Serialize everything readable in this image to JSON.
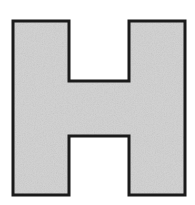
{
  "image": {
    "kind": "line-drawing",
    "subject": "letter-h-glyph",
    "label": "H",
    "description": "Outlined capital letter H filled with light gray texture on a white background",
    "width": 195,
    "height": 205
  },
  "colors": {
    "background": "#ffffff",
    "fill": "#c8c8c8",
    "fill_noise_light": "#d2d2d2",
    "fill_noise_dark": "#bebebe",
    "outline": "#1a1a1a"
  },
  "shape": {
    "name": "capital-h",
    "stroke_width": 3,
    "bounds": {
      "left": 13,
      "top": 21,
      "right": 185,
      "bottom": 195
    },
    "metrics": {
      "left_stem_left": 13,
      "left_stem_right": 69,
      "right_stem_left": 129,
      "right_stem_right": 185,
      "crossbar_top": 81,
      "crossbar_bottom": 136,
      "stem_width": 56,
      "crossbar_height": 55,
      "notch_width": 60
    },
    "path": "M 13 21 L 69 21 L 69 81 L 129 81 L 129 21 L 185 21 L 185 195 L 129 195 L 129 136 L 69 136 L 69 195 L 13 195 Z",
    "vertices": [
      [
        13,
        21
      ],
      [
        69,
        21
      ],
      [
        69,
        81
      ],
      [
        129,
        81
      ],
      [
        129,
        21
      ],
      [
        185,
        21
      ],
      [
        185,
        195
      ],
      [
        129,
        195
      ],
      [
        129,
        136
      ],
      [
        69,
        136
      ],
      [
        69,
        195
      ],
      [
        13,
        195
      ]
    ]
  },
  "parts": [
    {
      "name": "left-stem",
      "label": "Left vertical stem"
    },
    {
      "name": "right-stem",
      "label": "Right vertical stem"
    },
    {
      "name": "crossbar",
      "label": "Horizontal crossbar"
    },
    {
      "name": "top-notch",
      "label": "Top center cutout"
    },
    {
      "name": "bottom-notch",
      "label": "Bottom center cutout"
    }
  ]
}
